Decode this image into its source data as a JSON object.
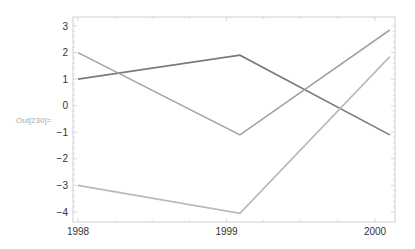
{
  "cell": {
    "out_label": "Out[230]="
  },
  "chart_data": {
    "type": "line",
    "title": "",
    "xlabel": "",
    "ylabel": "",
    "xlim": [
      1997.97,
      2000.15
    ],
    "ylim": [
      -4.4,
      3.35
    ],
    "x_ticks": [
      1998,
      1999,
      2000
    ],
    "y_ticks": [
      3,
      2,
      1,
      0,
      -1,
      -2,
      -3,
      -4
    ],
    "grid": false,
    "legend": null,
    "series": [
      {
        "name": "series-1",
        "color": "#7a7a7a",
        "points": [
          [
            1998,
            1
          ],
          [
            1999.09,
            1.9
          ],
          [
            2000.1,
            -1.1
          ]
        ]
      },
      {
        "name": "series-2",
        "color": "#a3a3a3",
        "points": [
          [
            1998,
            2
          ],
          [
            1999.09,
            -1.1
          ],
          [
            2000.1,
            2.85
          ]
        ]
      },
      {
        "name": "series-3",
        "color": "#b9b9b9",
        "points": [
          [
            1998,
            -3
          ],
          [
            1999.09,
            -4.05
          ],
          [
            2000.1,
            1.85
          ]
        ]
      }
    ]
  },
  "frame": {
    "left": 73,
    "right": 395,
    "top": 17,
    "bottom": 222,
    "color": "#d0d0d0"
  }
}
